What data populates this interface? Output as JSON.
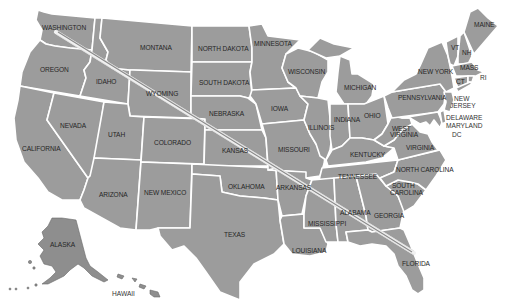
{
  "map": {
    "title": "United States map",
    "colors": {
      "state_fill": "#9c9c9c",
      "border": "#ffffff",
      "label": "#262626",
      "route": "#f2f2f2"
    },
    "route": {
      "from": "WASHINGTON",
      "to": "FLORIDA",
      "start": [
        56,
        32
      ],
      "end": [
        414,
        253
      ]
    },
    "labels": {
      "washington": "WASHINGTON",
      "oregon": "OREGON",
      "california": "CALIFORNIA",
      "idaho": "IDAHO",
      "nevada": "NEVADA",
      "montana": "MONTANA",
      "wyoming": "WYOMING",
      "utah": "UTAH",
      "arizona": "ARIZONA",
      "colorado": "COLORADO",
      "new_mexico": "NEW MEXICO",
      "north_dakota": "NORTH DAKOTA",
      "south_dakota": "SOUTH DAKOTA",
      "nebraska": "NEBRASKA",
      "kansas": "KANSAS",
      "oklahoma": "OKLAHOMA",
      "texas": "TEXAS",
      "minnesota": "MINNESOTA",
      "iowa": "IOWA",
      "missouri": "MISSOURI",
      "arkansas": "ARKANSAS",
      "louisiana": "LOUISIANA",
      "wisconsin": "WISCONSIN",
      "illinois": "ILLINOIS",
      "michigan": "MICHIGAN",
      "indiana": "INDIANA",
      "ohio": "OHIO",
      "kentucky": "KENTUCKY",
      "tennessee": "TENNESSEE",
      "mississippi": "MISSISSIPPI",
      "alabama": "ALABAMA",
      "georgia": "GEORGIA",
      "florida": "FLORIDA",
      "south_carolina_1": "SOUTH",
      "south_carolina_2": "CAROLINA",
      "north_carolina": "NORTH CAROLINA",
      "virginia": "VIRGINIA",
      "west_virginia_1": "WEST",
      "west_virginia_2": "VIRGINIA",
      "pennsylvania": "PENNSYLVANIA",
      "new_york": "NEW YORK",
      "new_jersey_1": "NEW",
      "new_jersey_2": "JERSEY",
      "delaware": "DELAWARE",
      "maryland": "MARYLAND",
      "dc": "DC",
      "vermont": "VT",
      "new_hampshire": "NH",
      "maine": "MAINE",
      "massachusetts": "MASS",
      "connecticut": "CT",
      "rhode_island": "RI",
      "alaska": "ALASKA",
      "hawaii": "HAWAII"
    }
  }
}
